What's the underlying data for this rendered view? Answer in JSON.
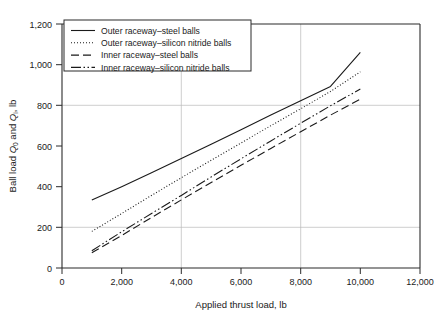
{
  "chart_data": {
    "type": "line",
    "title": "",
    "xlabel": "Applied thrust load, lb",
    "ylabel": "Ball load Q0 and Qi, lb",
    "ylabel_parts": {
      "prefix": "Ball load ",
      "q_outer": "Q",
      "q_outer_sub": "0",
      "mid": " and ",
      "q_inner": "Q",
      "q_inner_sub": "i",
      "suffix": ", lb"
    },
    "xlim": [
      0,
      12000
    ],
    "ylim": [
      0,
      1200
    ],
    "xticks": [
      0,
      2000,
      4000,
      6000,
      8000,
      10000,
      12000
    ],
    "xtick_labels": [
      "0",
      "2,000",
      "4,000",
      "6,000",
      "8,000",
      "10,000",
      "12,000"
    ],
    "yticks": [
      0,
      200,
      400,
      600,
      800,
      1000,
      1200
    ],
    "ytick_labels": [
      "0",
      "200",
      "400",
      "600",
      "800",
      "1,000",
      "1,200"
    ],
    "grid": true,
    "gridlines_x": [
      4000,
      8000
    ],
    "gridlines_y": [
      200,
      800
    ],
    "legend_position": "upper-left",
    "x": [
      1000,
      2000,
      3000,
      4000,
      5000,
      6000,
      7000,
      8000,
      9000,
      10000
    ],
    "series": [
      {
        "name": "Outer raceway–steel balls",
        "style": "solid",
        "color": "#1a1a1a",
        "values": [
          335,
          400,
          468,
          538,
          608,
          680,
          752,
          823,
          893,
          1060
        ]
      },
      {
        "name": "Outer raceway–silicon nitride balls",
        "style": "dotted",
        "color": "#1a1a1a",
        "values": [
          180,
          268,
          357,
          444,
          530,
          615,
          700,
          783,
          868,
          965
        ]
      },
      {
        "name": "Inner raceway–steel balls",
        "style": "dashed",
        "color": "#1a1a1a",
        "values": [
          75,
          160,
          248,
          335,
          420,
          505,
          588,
          670,
          752,
          830
        ]
      },
      {
        "name": "Inner raceway–silicon nitride balls",
        "style": "dashdotdot",
        "color": "#1a1a1a",
        "values": [
          85,
          178,
          268,
          357,
          448,
          537,
          625,
          712,
          798,
          880
        ]
      }
    ]
  },
  "legend": {
    "items": [
      {
        "label": "Outer raceway–steel balls",
        "style": "solid"
      },
      {
        "label": "Outer raceway–silicon nitride balls",
        "style": "dotted"
      },
      {
        "label": "Inner raceway–steel balls",
        "style": "dashed"
      },
      {
        "label": "Inner raceway–silicon nitride balls",
        "style": "dashdotdot"
      }
    ]
  },
  "colors": {
    "ink": "#1a1a1a",
    "grid": "#b9b9b9",
    "frame": "#2b2b2b",
    "background": "#ffffff"
  }
}
